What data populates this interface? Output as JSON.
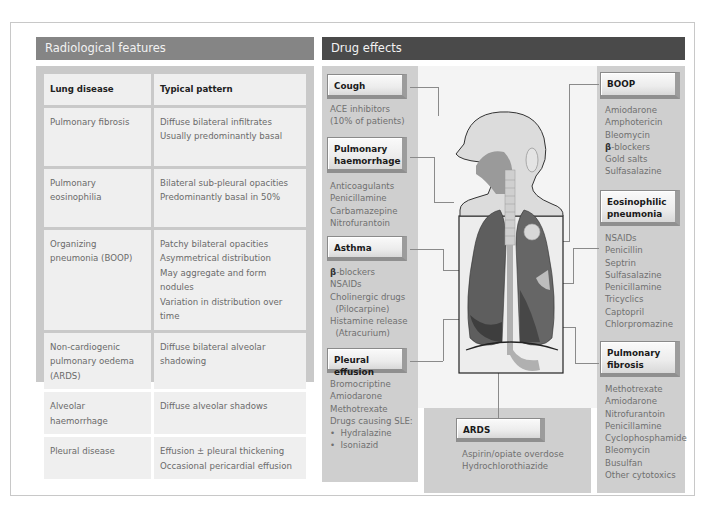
{
  "radiological": {
    "title": "Radiological features",
    "headers": [
      "Lung disease",
      "Typical pattern"
    ],
    "rows": [
      {
        "disease": "Pulmonary fibrosis",
        "pattern": [
          "Diffuse bilateral infiltrates",
          "Usually predominantly basal"
        ]
      },
      {
        "disease": "Pulmonary eosinophilia",
        "pattern": [
          "Bilateral sub-pleural opacities",
          "Predominantly basal in 50%"
        ]
      },
      {
        "disease": "Organizing pneumonia (BOOP)",
        "pattern": [
          "Patchy bilateral opacities",
          "Asymmetrical distribution",
          "May aggregate and form nodules",
          "Variation in distribution over time"
        ]
      },
      {
        "disease": "Non-cardiogenic pulmonary oedema (ARDS)",
        "pattern": [
          "Diffuse bilateral alveolar",
          "shadowing"
        ]
      },
      {
        "disease": "Alveolar haemorrhage",
        "pattern": [
          "Diffuse alveolar shadows"
        ]
      },
      {
        "disease": "Pleural disease",
        "pattern": [
          "Effusion ± pleural thickening",
          "Occasional pericardial effusion"
        ]
      }
    ]
  },
  "drug_effects": {
    "title": "Drug effects",
    "cough": {
      "label": "Cough",
      "items": "ACE inhibitors\n(10% of patients)"
    },
    "haemorrhage": {
      "label": "Pulmonary haemorrhage",
      "items": "Anticoagulants\nPenicillamine\nCarbamazepine\nNitrofurantoin"
    },
    "asthma": {
      "label": "Asthma",
      "beta": "β",
      "items_first": "-blockers",
      "items": "NSAIDs\nCholinergic drugs\n  (Pilocarpine)\nHistamine release\n  (Atracurium)"
    },
    "pleural": {
      "label": "Pleural effusion",
      "items": "Bromocriptine\nAmiodarone\nMethotrexate\nDrugs causing SLE:\n•  Hydralazine\n•  Isoniazid"
    },
    "boop": {
      "label": "BOOP",
      "items_a": "Amiodarone\nAmphotericin\nBleomycin",
      "beta": "β",
      "items_beta": "-blockers",
      "items_b": "Gold salts\nSulfasalazine"
    },
    "eosinophilic": {
      "label": "Eosinophilic pneumonia",
      "items": "NSAIDs\nPenicillin\nSeptrin\nSulfasalazine\nPenicillamine\nTricyclics\nCaptopril\nChlorpromazine"
    },
    "fibrosis": {
      "label": "Pulmonary fibrosis",
      "items": "Methotrexate\nAmiodarone\nNitrofurantoin\nPenicillamine\nCyclophosphamide\nBleomycin\nBusulfan\nOther cytotoxics"
    },
    "ards": {
      "label": "ARDS",
      "items": "Aspirin/opiate overdose\nHydrochlorothiazide"
    }
  },
  "colors": {
    "radiological_header": "#858585",
    "drug_header": "#4a4a4a",
    "panel_grey": "#cfcfcf",
    "cell_bg": "#efefef",
    "lung": "#5e5e5e"
  }
}
